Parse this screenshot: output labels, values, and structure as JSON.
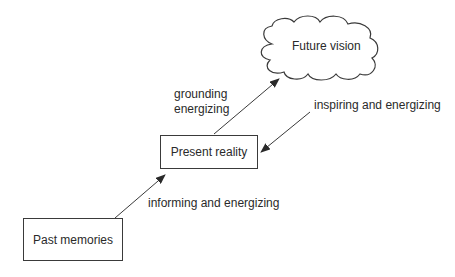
{
  "diagram": {
    "nodes": [
      {
        "id": "future",
        "label": "Future vision",
        "shape": "cloud"
      },
      {
        "id": "present",
        "label": "Present reality",
        "shape": "rectangle"
      },
      {
        "id": "past",
        "label": "Past memories",
        "shape": "rectangle"
      }
    ],
    "edges": [
      {
        "from": "present",
        "to": "future",
        "label_line1": "grounding",
        "label_line2": "energizing"
      },
      {
        "from": "future",
        "to": "present",
        "label": "inspiring and energizing"
      },
      {
        "from": "past",
        "to": "present",
        "label": "informing and energizing"
      }
    ],
    "colors": {
      "stroke": "#3a3a3a",
      "text": "#2a2a2a",
      "background": "#ffffff"
    }
  }
}
